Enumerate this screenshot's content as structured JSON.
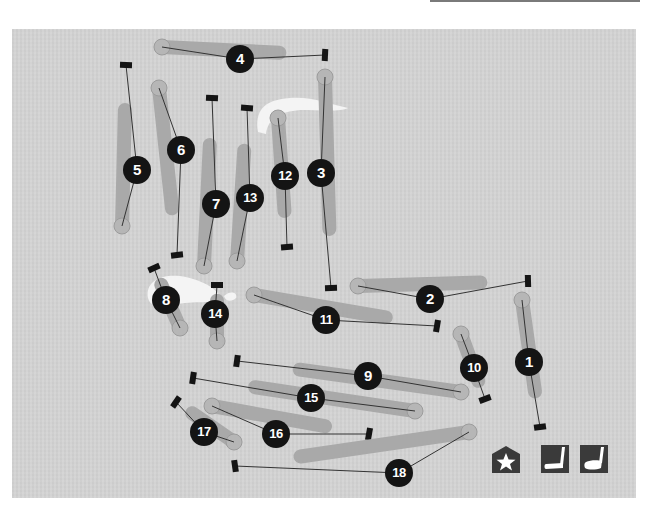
{
  "map": {
    "type": "golf-course-layout",
    "colors": {
      "background": "#d3d3d3",
      "fairway": "#a9a9a9",
      "green": "#b6b6b6",
      "hazard": "#f4f4f4",
      "tee": "#141414",
      "line": "#333333",
      "badge": "#141414"
    },
    "holes": [
      {
        "number": "1",
        "tee": [
          540,
          427
        ],
        "green": [
          522,
          300
        ],
        "badge": [
          529,
          362
        ]
      },
      {
        "number": "2",
        "tee": [
          528,
          281
        ],
        "green": [
          358,
          286
        ],
        "badge": [
          430,
          299
        ]
      },
      {
        "number": "3",
        "tee": [
          331,
          288
        ],
        "green": [
          325,
          77
        ],
        "badge": [
          321,
          173
        ]
      },
      {
        "number": "4",
        "tee": [
          325,
          55
        ],
        "green": [
          162,
          47
        ],
        "badge": [
          240,
          59
        ]
      },
      {
        "number": "5",
        "tee": [
          126,
          65
        ],
        "green": [
          122,
          226
        ],
        "badge": [
          137,
          170
        ]
      },
      {
        "number": "6",
        "tee": [
          177,
          255
        ],
        "green": [
          159,
          88
        ],
        "badge": [
          181,
          150
        ]
      },
      {
        "number": "7",
        "tee": [
          212,
          98
        ],
        "green": [
          204,
          266
        ],
        "badge": [
          216,
          204
        ]
      },
      {
        "number": "8",
        "tee": [
          154,
          268
        ],
        "green": [
          180,
          328
        ],
        "badge": [
          166,
          300
        ]
      },
      {
        "number": "9",
        "tee": [
          237,
          361
        ],
        "green": [
          461,
          392
        ],
        "badge": [
          368,
          376
        ]
      },
      {
        "number": "10",
        "tee": [
          485,
          399
        ],
        "green": [
          461,
          334
        ],
        "badge": [
          474,
          368
        ]
      },
      {
        "number": "11",
        "tee": [
          437,
          326
        ],
        "green": [
          254,
          295
        ],
        "badge": [
          326,
          320
        ]
      },
      {
        "number": "12",
        "tee": [
          287,
          247
        ],
        "green": [
          278,
          118
        ],
        "badge": [
          285,
          176
        ]
      },
      {
        "number": "13",
        "tee": [
          247,
          108
        ],
        "green": [
          237,
          261
        ],
        "badge": [
          250,
          198
        ]
      },
      {
        "number": "14",
        "tee": [
          217,
          285
        ],
        "green": [
          217,
          341
        ],
        "badge": [
          215,
          314
        ]
      },
      {
        "number": "15",
        "tee": [
          193,
          378
        ],
        "green": [
          415,
          411
        ],
        "badge": [
          311,
          398
        ]
      },
      {
        "number": "16",
        "tee": [
          369,
          434
        ],
        "green": [
          212,
          406
        ],
        "badge": [
          276,
          434
        ]
      },
      {
        "number": "17",
        "tee": [
          176,
          402
        ],
        "green": [
          234,
          442
        ],
        "badge": [
          204,
          432
        ]
      },
      {
        "number": "18",
        "tee": [
          235,
          466
        ],
        "green": [
          469,
          432
        ],
        "badge": [
          399,
          473
        ]
      }
    ]
  },
  "legend": [
    {
      "name": "clubhouse",
      "icon": "clubhouse-star-icon"
    },
    {
      "name": "putting-green",
      "icon": "putter-icon"
    },
    {
      "name": "driving-range",
      "icon": "driver-icon"
    }
  ]
}
